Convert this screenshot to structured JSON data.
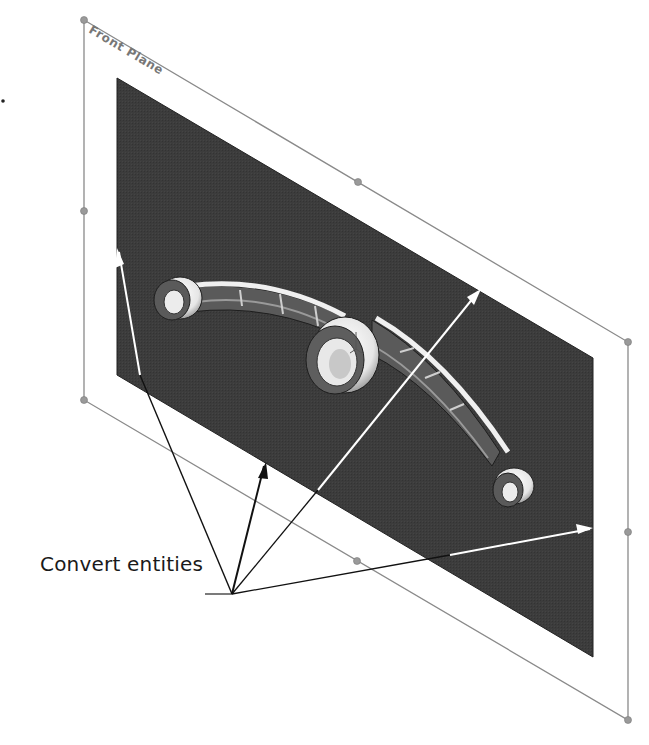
{
  "diagram": {
    "plane_label": "Front Plane",
    "callout_label": "Convert entities",
    "colors": {
      "background": "#ffffff",
      "plane_frame": "#8a8a8a",
      "handle": "#9a9a9a",
      "sketch_panel": "#3a3a3a",
      "part_light": "#f2f2f2",
      "part_dark": "#6a6a6a",
      "white_arrow": "#ffffff",
      "black_arrow": "#111111"
    },
    "plane_frame": {
      "corners": [
        [
          84,
          20
        ],
        [
          628,
          342
        ],
        [
          628,
          720
        ],
        [
          84,
          400
        ]
      ]
    },
    "sketch_panel": {
      "corners": [
        [
          117,
          78
        ],
        [
          593,
          358
        ],
        [
          593,
          657
        ],
        [
          117,
          375
        ]
      ]
    },
    "callout_origin": [
      232,
      595
    ],
    "arrow_targets": [
      [
        117,
        250
      ],
      [
        265,
        462
      ],
      [
        478,
        290
      ],
      [
        593,
        528
      ]
    ]
  }
}
